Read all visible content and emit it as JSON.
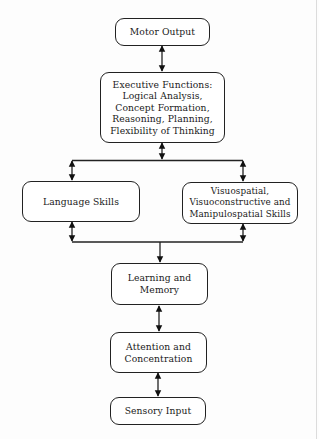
{
  "diagram": {
    "type": "flowchart",
    "direction": "bottom-to-top hierarchy with bidirectional links",
    "nodes": {
      "motor_output": {
        "label": "Motor Output"
      },
      "executive_functions": {
        "label": "Executive Functions:\nLogical Analysis,\nConcept Formation,\nReasoning, Planning,\nFlexibility of Thinking"
      },
      "language_skills": {
        "label": "Language Skills"
      },
      "visuospatial_skills": {
        "label": "Visuospatial,\nVisuoconstructive and\nManipulospatial Skills"
      },
      "learning_memory": {
        "label": "Learning and\nMemory"
      },
      "attention_concentration": {
        "label": "Attention and\nConcentration"
      },
      "sensory_input": {
        "label": "Sensory Input"
      }
    },
    "edges": [
      {
        "from": "motor_output",
        "to": "executive_functions",
        "arrow": "both"
      },
      {
        "from": "executive_functions",
        "to": "top-bus",
        "arrow": "both"
      },
      {
        "from": "top-bus",
        "to": "language_skills",
        "arrow": "both"
      },
      {
        "from": "top-bus",
        "to": "visuospatial_skills",
        "arrow": "both"
      },
      {
        "from": "language_skills",
        "to": "bottom-bus",
        "arrow": "both"
      },
      {
        "from": "visuospatial_skills",
        "to": "bottom-bus",
        "arrow": "both"
      },
      {
        "from": "bottom-bus",
        "to": "learning_memory",
        "arrow": "down"
      },
      {
        "from": "learning_memory",
        "to": "attention_concentration",
        "arrow": "both"
      },
      {
        "from": "attention_concentration",
        "to": "sensory_input",
        "arrow": "both"
      }
    ],
    "colors": {
      "stroke": "#222222",
      "background": "#fdfdfd"
    }
  }
}
